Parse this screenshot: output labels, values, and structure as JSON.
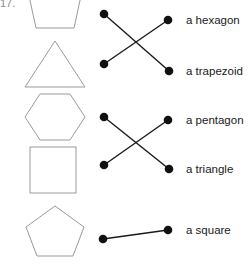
{
  "worksheet": {
    "question_number": "17.",
    "stroke_color": "#9a9a9a",
    "line_color": "#1a1a1a",
    "dot_color": "#111111",
    "text_color": "#1a1a1a",
    "background": "#ffffff",
    "width": 251,
    "height": 274
  },
  "shapes": [
    {
      "name": "trapezoid",
      "icon": "trapezoid-shape",
      "cx": 55,
      "cy": 12,
      "clipped_top": true
    },
    {
      "name": "triangle",
      "icon": "triangle-shape",
      "cx": 55,
      "cy": 64
    },
    {
      "name": "hexagon",
      "icon": "hexagon-shape",
      "cx": 55,
      "cy": 117
    },
    {
      "name": "square",
      "icon": "square-shape",
      "cx": 55,
      "cy": 168
    },
    {
      "name": "pentagon",
      "icon": "pentagon-shape",
      "cx": 55,
      "cy": 232
    }
  ],
  "left_dots": [
    {
      "id": "left-dot-1",
      "x": 104,
      "y": 14
    },
    {
      "id": "left-dot-2",
      "x": 104,
      "y": 64
    },
    {
      "id": "left-dot-3",
      "x": 104,
      "y": 117
    },
    {
      "id": "left-dot-4",
      "x": 104,
      "y": 165
    },
    {
      "id": "left-dot-5",
      "x": 103,
      "y": 239
    }
  ],
  "right_dots": [
    {
      "id": "right-dot-1",
      "x": 168,
      "y": 20
    },
    {
      "id": "right-dot-2",
      "x": 169,
      "y": 71
    },
    {
      "id": "right-dot-3",
      "x": 168,
      "y": 120
    },
    {
      "id": "right-dot-4",
      "x": 169,
      "y": 169
    },
    {
      "id": "right-dot-5",
      "x": 168,
      "y": 230
    }
  ],
  "labels": [
    {
      "id": "label-hexagon",
      "text": "a hexagon",
      "x": 186,
      "y": 14
    },
    {
      "id": "label-trapezoid",
      "text": "a trapezoid",
      "x": 186,
      "y": 65
    },
    {
      "id": "label-pentagon",
      "text": "a pentagon",
      "x": 186,
      "y": 114
    },
    {
      "id": "label-triangle",
      "text": "a triangle",
      "x": 186,
      "y": 163
    },
    {
      "id": "label-square",
      "text": "a square",
      "x": 186,
      "y": 224
    }
  ],
  "connections": [
    {
      "id": "line-1",
      "from": 0,
      "to": 1,
      "from_label": "trapezoid-shape",
      "to_label": "a trapezoid"
    },
    {
      "id": "line-2",
      "from": 1,
      "to": 0,
      "from_label": "triangle-shape",
      "to_label": "a hexagon"
    },
    {
      "id": "line-3",
      "from": 2,
      "to": 3,
      "from_label": "hexagon-shape",
      "to_label": "a triangle"
    },
    {
      "id": "line-4",
      "from": 3,
      "to": 2,
      "from_label": "square-shape",
      "to_label": "a pentagon"
    },
    {
      "id": "line-5",
      "from": 4,
      "to": 4,
      "from_label": "pentagon-shape",
      "to_label": "a square"
    }
  ]
}
